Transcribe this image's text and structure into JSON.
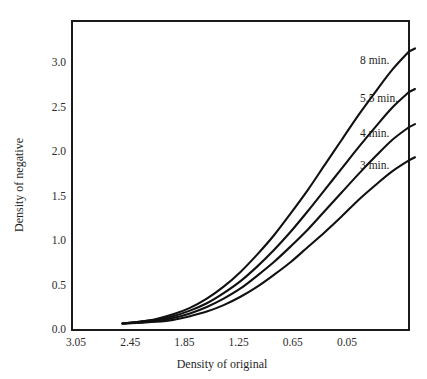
{
  "chart_data": {
    "type": "line",
    "title": "",
    "xlabel": "Density of original",
    "ylabel": "Density of negative",
    "grid": false,
    "legend_position": "inline-right-of-curve-ends",
    "x_tick_labels": [
      "3.05",
      "2.45",
      "1.85",
      "1.25",
      "0.65",
      "0.05"
    ],
    "x_tick_values": [
      3.05,
      2.45,
      1.85,
      1.25,
      0.65,
      0.05
    ],
    "x_axis_direction": "reversed",
    "xlim": [
      3.05,
      0.05
    ],
    "y_tick_labels": [
      "0.0",
      "0.5",
      "1.0",
      "1.5",
      "2.0",
      "2.5",
      "3.0"
    ],
    "y_tick_values": [
      0.0,
      0.5,
      1.0,
      1.5,
      2.0,
      2.5,
      3.0
    ],
    "ylim": [
      0.0,
      3.35
    ],
    "series": [
      {
        "name": "8 min.",
        "label": "8 min.",
        "color": "#111111",
        "x": [
          2.6,
          2.45,
          2.3,
          2.15,
          2.0,
          1.85,
          1.7,
          1.55,
          1.4,
          1.25,
          1.1,
          0.95,
          0.8,
          0.65,
          0.5,
          0.35,
          0.2,
          0.05
        ],
        "y": [
          0.07,
          0.09,
          0.12,
          0.17,
          0.24,
          0.34,
          0.47,
          0.63,
          0.82,
          1.03,
          1.27,
          1.52,
          1.79,
          2.06,
          2.33,
          2.58,
          2.82,
          3.02
        ]
      },
      {
        "name": "5.5 min.",
        "label": "5.5 min.",
        "color": "#111111",
        "x": [
          2.6,
          2.45,
          2.3,
          2.15,
          2.0,
          1.85,
          1.7,
          1.55,
          1.4,
          1.25,
          1.1,
          0.95,
          0.8,
          0.65,
          0.5,
          0.35,
          0.2,
          0.05
        ],
        "y": [
          0.07,
          0.09,
          0.11,
          0.15,
          0.21,
          0.29,
          0.4,
          0.53,
          0.69,
          0.87,
          1.07,
          1.29,
          1.52,
          1.75,
          1.98,
          2.2,
          2.41,
          2.58
        ]
      },
      {
        "name": "4 min.",
        "label": "4 min.",
        "color": "#111111",
        "x": [
          2.6,
          2.45,
          2.3,
          2.15,
          2.0,
          1.85,
          1.7,
          1.55,
          1.4,
          1.25,
          1.1,
          0.95,
          0.8,
          0.65,
          0.5,
          0.35,
          0.2,
          0.05
        ],
        "y": [
          0.07,
          0.08,
          0.1,
          0.13,
          0.18,
          0.25,
          0.34,
          0.45,
          0.59,
          0.74,
          0.91,
          1.09,
          1.29,
          1.49,
          1.69,
          1.88,
          2.06,
          2.2
        ]
      },
      {
        "name": "3 min.",
        "label": "3 min.",
        "color": "#111111",
        "x": [
          2.6,
          2.45,
          2.3,
          2.15,
          2.0,
          1.85,
          1.7,
          1.55,
          1.4,
          1.25,
          1.1,
          0.95,
          0.8,
          0.65,
          0.5,
          0.35,
          0.2,
          0.05
        ],
        "y": [
          0.07,
          0.08,
          0.09,
          0.11,
          0.15,
          0.2,
          0.27,
          0.36,
          0.47,
          0.6,
          0.74,
          0.9,
          1.06,
          1.23,
          1.41,
          1.57,
          1.72,
          1.84
        ]
      }
    ],
    "frame": {
      "color": "#1a1a1a",
      "left_px": 72,
      "right_px": 409,
      "top_px": 21,
      "bottom_px": 330
    }
  }
}
